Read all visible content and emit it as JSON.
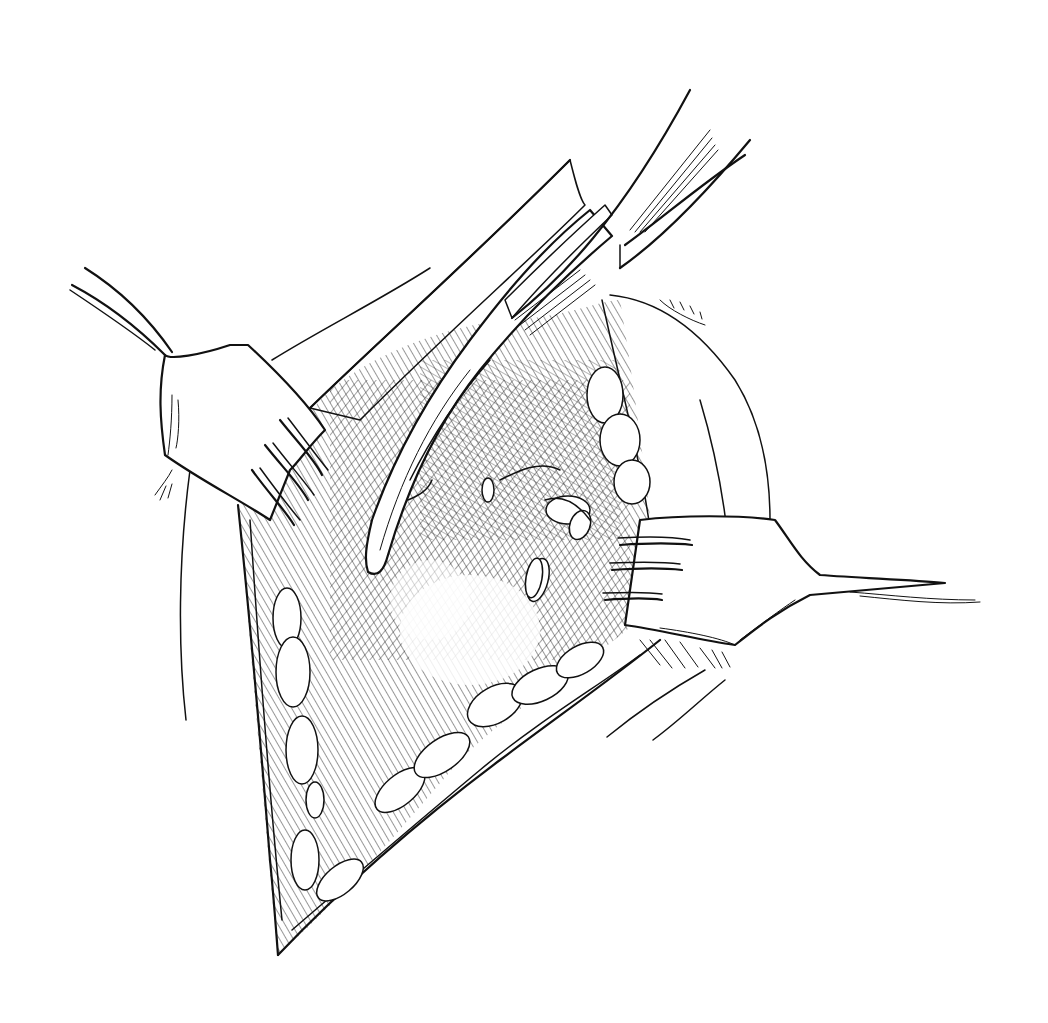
{
  "illustration": {
    "title": "Surgical exposure with retractors and curved clamp",
    "style": "black ink line drawing",
    "colors": {
      "ink": "#111111",
      "background": "#ffffff"
    },
    "elements": {
      "left_retractor": "rake retractor (left, 4 prongs)",
      "right_retractor": "rake retractor (right, 3 prongs)",
      "clamp": "curved serrated clamp",
      "wound": "incision with exposed tissue",
      "fat_lobules": "subcutaneous fat lobules along wound edge"
    }
  }
}
